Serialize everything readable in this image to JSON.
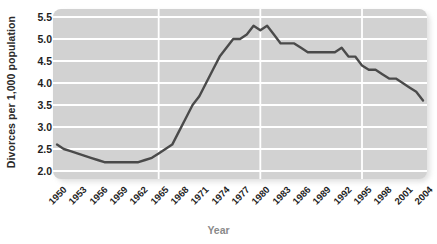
{
  "chart_data": {
    "type": "line",
    "title": "",
    "xlabel": "Year",
    "ylabel": "Divorces per 1,000 population",
    "xlim": [
      1950,
      2004
    ],
    "ylim": [
      2.0,
      5.5
    ],
    "grid": true,
    "legend": "none",
    "line_color": "#4a4a4a",
    "plot_bg_color": "#d2d2d2",
    "gridline_color": "#ffffff",
    "page_bg_color": "#ffffff",
    "y_ticks": [
      "2.0",
      "2.5",
      "3.0",
      "3.5",
      "4.0",
      "4.5",
      "5.0",
      "5.5"
    ],
    "y_tick_values": [
      2.0,
      2.5,
      3.0,
      3.5,
      4.0,
      4.5,
      5.0,
      5.5
    ],
    "x_ticks": [
      "1950",
      "1953",
      "1956",
      "1959",
      "1962",
      "1965",
      "1968",
      "1971",
      "1974",
      "1977",
      "1980",
      "1983",
      "1986",
      "1989",
      "1992",
      "1995",
      "1998",
      "2001",
      "2004"
    ],
    "x_tick_values": [
      1950,
      1953,
      1956,
      1959,
      1962,
      1965,
      1968,
      1971,
      1974,
      1977,
      1980,
      1983,
      1986,
      1989,
      1992,
      1995,
      1998,
      2001,
      2004
    ],
    "x_gridline_values": [
      1965,
      1980,
      1995
    ],
    "x": [
      1950,
      1951,
      1952,
      1953,
      1954,
      1955,
      1956,
      1957,
      1958,
      1959,
      1960,
      1961,
      1962,
      1963,
      1964,
      1965,
      1966,
      1967,
      1968,
      1969,
      1970,
      1971,
      1972,
      1973,
      1974,
      1975,
      1976,
      1977,
      1978,
      1979,
      1980,
      1981,
      1982,
      1983,
      1984,
      1985,
      1986,
      1987,
      1988,
      1989,
      1990,
      1991,
      1992,
      1993,
      1994,
      1995,
      1996,
      1997,
      1998,
      1999,
      2000,
      2001,
      2002,
      2003,
      2004
    ],
    "values": [
      2.6,
      2.5,
      2.45,
      2.4,
      2.35,
      2.3,
      2.25,
      2.2,
      2.2,
      2.2,
      2.2,
      2.2,
      2.2,
      2.25,
      2.3,
      2.4,
      2.5,
      2.6,
      2.9,
      3.2,
      3.5,
      3.7,
      4.0,
      4.3,
      4.6,
      4.8,
      5.0,
      5.0,
      5.1,
      5.3,
      5.2,
      5.3,
      5.1,
      4.9,
      4.9,
      4.9,
      4.8,
      4.7,
      4.7,
      4.7,
      4.7,
      4.7,
      4.8,
      4.6,
      4.6,
      4.4,
      4.3,
      4.3,
      4.2,
      4.1,
      4.1,
      4.0,
      3.9,
      3.8,
      3.6
    ],
    "data_source_note": "",
    "annotations": []
  },
  "axis": {
    "y_title": "Divorces per 1,000 population",
    "x_title": "Year"
  }
}
